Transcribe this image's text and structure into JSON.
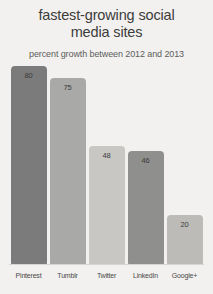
{
  "chart_data": {
    "type": "bar",
    "title": "fastest-growing social\nmedia sites",
    "subtitle": "percent growth between 2012 and 2013",
    "xlabel": "",
    "ylabel": "",
    "ylim": [
      0,
      80
    ],
    "grid": false,
    "legend": "none",
    "categories": [
      "Pinterest",
      "Tumblr",
      "Twitter",
      "LinkedIn",
      "Google+"
    ],
    "values": [
      80,
      75,
      48,
      46,
      20
    ],
    "bars": [
      {
        "label": "Pinterest",
        "value": 80,
        "value_text": "80",
        "color": "#7b7b7b"
      },
      {
        "label": "Tumblr",
        "value": 75,
        "value_text": "75",
        "color": "#a9a9a7"
      },
      {
        "label": "Twitter",
        "value": 48,
        "value_text": "48",
        "color": "#c8c7c3"
      },
      {
        "label": "LinkedIn",
        "value": 46,
        "value_text": "46",
        "color": "#8f8f8d"
      },
      {
        "label": "Google+",
        "value": 20,
        "value_text": "20",
        "color": "#bcbbb7"
      }
    ],
    "colors": {
      "background": "#f2f1ef",
      "title": "#3c3c3c",
      "subtitle": "#5d5d5d",
      "axis_line": "#d8d6d3",
      "value_label": "#3a3a3a",
      "category_label": "#4a4a4a"
    }
  }
}
